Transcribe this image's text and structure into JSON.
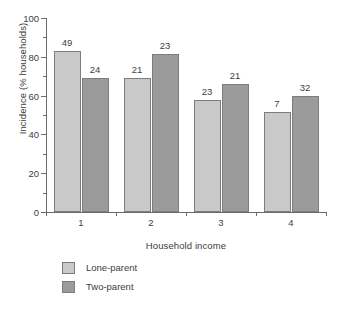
{
  "chart_data": {
    "type": "bar",
    "title": "",
    "xlabel": "Household income",
    "ylabel": "Incidence (% households)",
    "categories": [
      "1",
      "2",
      "3",
      "4"
    ],
    "ylim": [
      0,
      100
    ],
    "yticks": [
      0,
      20,
      40,
      60,
      80,
      100
    ],
    "yticks_minor": [
      10,
      30,
      50,
      70,
      90
    ],
    "grid": false,
    "legend_position": "below-left",
    "series": [
      {
        "name": "Lone-parent",
        "color": "#c9c9c9",
        "values": [
          83,
          69,
          57.5,
          51.5
        ],
        "point_labels": [
          "49",
          "21",
          "23",
          "7"
        ]
      },
      {
        "name": "Two-parent",
        "color": "#9b9b9b",
        "values": [
          69,
          81.5,
          66,
          60
        ],
        "point_labels": [
          "24",
          "23",
          "21",
          "32"
        ]
      }
    ]
  }
}
